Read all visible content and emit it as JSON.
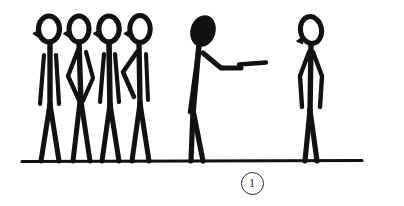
{
  "artwork": {
    "title": "Stick figure scene sketch",
    "medium": "black ink line drawing",
    "background_color": "#ffffff",
    "ink_color": "#131110",
    "caption": {
      "label": "1",
      "style": "circled numeral",
      "position": "below ground line, center-right"
    },
    "ground_line": {
      "name": "ground-line",
      "x_start": 22,
      "x_end": 362,
      "y": 161,
      "thickness": 3
    },
    "figures": [
      {
        "id": "figure-1",
        "label": "standing figure, arms at sides",
        "group": "left-crowd",
        "head_style": "open oval outline with small nose nub on left",
        "head_fill": "none",
        "pose": "upright, facing left, arms down along body",
        "x": 48,
        "head_top_y": 16,
        "foot_y": 161
      },
      {
        "id": "figure-2",
        "label": "standing figure, arm akimbo",
        "group": "left-crowd",
        "head_style": "open oval outline with small nose nub on left",
        "head_fill": "none",
        "pose": "upright, left arm bent forming diamond with torso",
        "x": 78,
        "head_top_y": 16,
        "foot_y": 161
      },
      {
        "id": "figure-3",
        "label": "standing figure, arms at sides",
        "group": "left-crowd",
        "head_style": "open oval outline with small nose nub on left",
        "head_fill": "none",
        "pose": "upright, facing left, arms down along body",
        "x": 107,
        "head_top_y": 16,
        "foot_y": 161
      },
      {
        "id": "figure-4",
        "label": "standing figure, hand on hip",
        "group": "left-crowd",
        "head_style": "open oval outline with small nose nub on left",
        "head_fill": "none",
        "pose": "upright, right arm bent with elbow out to the left",
        "x": 137,
        "head_top_y": 16,
        "foot_y": 161
      },
      {
        "id": "figure-5",
        "label": "leaning figure pointing right",
        "group": "center",
        "head_style": "solid filled oval, tilted",
        "head_fill": "solid black",
        "pose": "leaning forward, arm extended to the right, index finger pointing",
        "x": 200,
        "head_top_y": 17,
        "foot_y": 161,
        "pointing_direction": "right",
        "finger_tip_x": 266,
        "finger_tip_y": 63
      },
      {
        "id": "figure-6",
        "label": "standing figure facing left",
        "group": "right",
        "head_style": "open oval outline, tilted left, small nub at lower left",
        "head_fill": "none",
        "pose": "upright, head tilted left, arms hanging at sides",
        "x": 312,
        "head_top_y": 16,
        "foot_y": 161
      }
    ]
  }
}
